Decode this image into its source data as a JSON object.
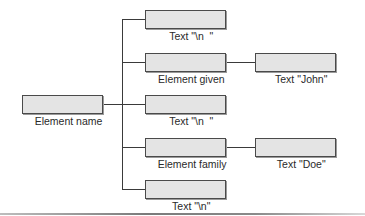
{
  "diagram": {
    "type": "tree",
    "root": {
      "label": "Element name"
    },
    "children": [
      {
        "label": "Text \"\\n  \""
      },
      {
        "label": "Element given",
        "child": {
          "label": "Text \"John\""
        }
      },
      {
        "label": "Text \"\\n  \""
      },
      {
        "label": "Element family",
        "child": {
          "label": "Text \"Doe\""
        }
      },
      {
        "label": "Text \"\\n\""
      }
    ]
  },
  "colors": {
    "node_fill": "#e4e4e4",
    "node_border": "#4a4a4a",
    "connector": "#3a3a3a"
  }
}
